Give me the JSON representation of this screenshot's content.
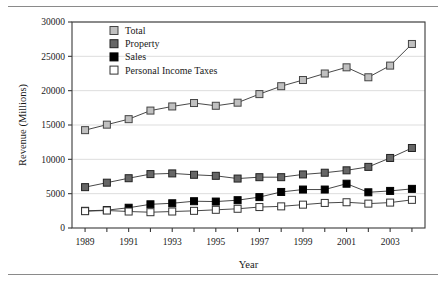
{
  "figure": {
    "rules": {
      "top": "horizontal-rule",
      "bottom": "horizontal-rule"
    }
  },
  "chart_data": {
    "type": "line",
    "title": "",
    "xlabel": "Year",
    "ylabel": "Revenue (Millions)",
    "x": [
      1989,
      1990,
      1991,
      1992,
      1993,
      1994,
      1995,
      1996,
      1997,
      1998,
      1999,
      2000,
      2001,
      2002,
      2003,
      2004
    ],
    "xtick_labels": [
      "1989",
      "1991",
      "1993",
      "1995",
      "1997",
      "1999",
      "2001",
      "2003"
    ],
    "xtick_values": [
      1989,
      1991,
      1993,
      1995,
      1997,
      1999,
      2001,
      2003
    ],
    "xlim": [
      1988.4,
      2004.6
    ],
    "ylim": [
      0,
      30000
    ],
    "ytick_labels": [
      "0",
      "5000",
      "10000",
      "15000",
      "20000",
      "25000",
      "30000"
    ],
    "ytick_values": [
      0,
      5000,
      10000,
      15000,
      20000,
      25000,
      30000
    ],
    "grid": "horizontal",
    "legend_position": "top-left-inside",
    "series": [
      {
        "name": "Total",
        "marker": "square",
        "fill": "#c0c0c0",
        "edge": "#444444",
        "values": [
          14250,
          15050,
          15850,
          17100,
          17700,
          18200,
          17800,
          18250,
          19500,
          20650,
          21550,
          22500,
          23400,
          21950,
          23650,
          26800
        ]
      },
      {
        "name": "Property",
        "marker": "square",
        "fill": "#666666",
        "edge": "#222222",
        "values": [
          5950,
          6600,
          7250,
          7850,
          7950,
          7750,
          7600,
          7200,
          7400,
          7400,
          7800,
          8050,
          8400,
          8900,
          10200,
          11650
        ]
      },
      {
        "name": "Sales",
        "marker": "square",
        "fill": "#000000",
        "edge": "#000000",
        "values": [
          2500,
          2600,
          2950,
          3450,
          3600,
          3900,
          3850,
          4050,
          4500,
          5250,
          5600,
          5600,
          6450,
          5200,
          5400,
          5700
        ]
      },
      {
        "name": "Personal Income Taxes",
        "marker": "square",
        "fill": "#ffffff",
        "edge": "#333333",
        "values": [
          2450,
          2550,
          2400,
          2300,
          2400,
          2500,
          2650,
          2800,
          3050,
          3150,
          3400,
          3650,
          3750,
          3550,
          3700,
          4100
        ]
      }
    ]
  }
}
